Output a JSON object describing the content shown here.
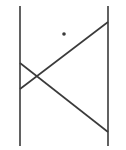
{
  "diagram": {
    "width": 126,
    "height": 150,
    "stroke_color": "#3a3a3a",
    "background": "#ffffff",
    "lines": [
      {
        "name": "left-parallel-line",
        "x1": 20,
        "y1": 6,
        "x2": 20,
        "y2": 146
      },
      {
        "name": "right-parallel-line",
        "x1": 108,
        "y1": 6,
        "x2": 108,
        "y2": 146
      },
      {
        "name": "upper-transversal",
        "x1": 20,
        "y1": 89,
        "x2": 108,
        "y2": 22
      },
      {
        "name": "lower-transversal",
        "x1": 20,
        "y1": 63,
        "x2": 108,
        "y2": 132
      }
    ],
    "points": [
      {
        "name": "marked-point",
        "cx": 64,
        "cy": 34,
        "r": 1.8
      }
    ]
  }
}
